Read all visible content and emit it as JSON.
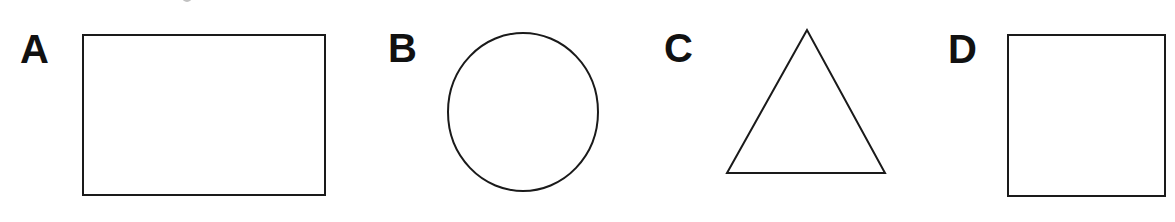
{
  "figure": {
    "stroke_color": "#1a1a1a",
    "background": "#ffffff",
    "panels": [
      {
        "label": "A",
        "shape": "rectangle",
        "x": 83,
        "y": 35,
        "width": 242,
        "height": 160
      },
      {
        "label": "B",
        "shape": "circle",
        "cx": 523,
        "cy": 112,
        "rx": 75,
        "ry": 79
      },
      {
        "label": "C",
        "shape": "triangle",
        "points": "807,30 727,173 885,173"
      },
      {
        "label": "D",
        "shape": "square",
        "x": 1008,
        "y": 35,
        "width": 157,
        "height": 161
      }
    ]
  }
}
